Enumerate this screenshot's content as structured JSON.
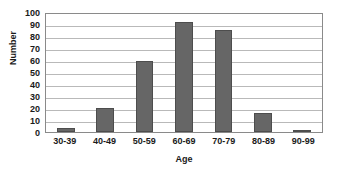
{
  "chart_data": {
    "type": "bar",
    "title": "",
    "xlabel": "Age",
    "ylabel": "Number",
    "categories": [
      "30-39",
      "40-49",
      "50-59",
      "60-69",
      "70-79",
      "80-89",
      "90-99"
    ],
    "values": [
      3,
      20,
      59,
      92,
      85,
      16,
      2
    ],
    "series": [
      {
        "name": "Number",
        "values": [
          3,
          20,
          59,
          92,
          85,
          16,
          2
        ]
      }
    ],
    "ylim": [
      0,
      100
    ],
    "yticks": [
      0,
      10,
      20,
      30,
      40,
      50,
      60,
      70,
      80,
      90,
      100
    ],
    "ytick_labels": [
      "0",
      "10",
      "20",
      "30",
      "40",
      "50",
      "60",
      "70",
      "80",
      "90",
      "100"
    ],
    "grid": "horizontal",
    "legend": "none",
    "bar_color": "#666666",
    "gridline_color": "#b9b9b9",
    "axis_color": "#8a8a8a",
    "background": "#ffffff"
  }
}
